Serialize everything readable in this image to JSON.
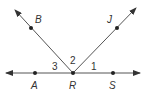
{
  "diagram": {
    "type": "geometry-angles",
    "colors": {
      "line": "#555555",
      "point": "#222222",
      "text": "#333333"
    },
    "line": {
      "name": "AS",
      "through": [
        "A",
        "R",
        "S"
      ],
      "both_arrows": true
    },
    "rays": [
      {
        "name": "RB",
        "from": "R",
        "through": "B"
      },
      {
        "name": "RJ",
        "from": "R",
        "through": "J"
      }
    ],
    "points": {
      "A": {
        "label": "A"
      },
      "R": {
        "label": "R"
      },
      "S": {
        "label": "S"
      },
      "B": {
        "label": "B"
      },
      "J": {
        "label": "J"
      }
    },
    "angles": {
      "a1": {
        "label": "1",
        "between": "RS and RJ"
      },
      "a2": {
        "label": "2",
        "between": "RJ and RB"
      },
      "a3": {
        "label": "3",
        "between": "RB and RA"
      }
    }
  }
}
